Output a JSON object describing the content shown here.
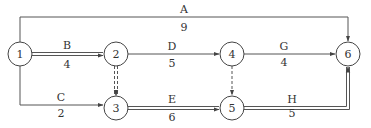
{
  "diagram": {
    "type": "activity-on-arrow network",
    "nodes": [
      {
        "id": "1",
        "label": "1",
        "x": 20,
        "y": 54
      },
      {
        "id": "2",
        "label": "2",
        "x": 116,
        "y": 54
      },
      {
        "id": "3",
        "label": "3",
        "x": 116,
        "y": 108
      },
      {
        "id": "4",
        "label": "4",
        "x": 232,
        "y": 54
      },
      {
        "id": "5",
        "label": "5",
        "x": 232,
        "y": 108
      },
      {
        "id": "6",
        "label": "6",
        "x": 348,
        "y": 54
      }
    ],
    "activities": [
      {
        "name": "A",
        "duration": "9",
        "from": "1",
        "to": "6",
        "critical": false
      },
      {
        "name": "B",
        "duration": "4",
        "from": "1",
        "to": "2",
        "critical": true
      },
      {
        "name": "C",
        "duration": "2",
        "from": "1",
        "to": "3",
        "critical": false
      },
      {
        "name": "D",
        "duration": "5",
        "from": "2",
        "to": "4",
        "critical": false
      },
      {
        "name": "E",
        "duration": "6",
        "from": "3",
        "to": "5",
        "critical": true
      },
      {
        "name": "G",
        "duration": "4",
        "from": "4",
        "to": "6",
        "critical": false
      },
      {
        "name": "H",
        "duration": "5",
        "from": "5",
        "to": "6",
        "critical": true
      }
    ],
    "dummies": [
      {
        "from": "2",
        "to": "3",
        "critical": true
      },
      {
        "from": "4",
        "to": "5",
        "critical": false
      }
    ]
  }
}
